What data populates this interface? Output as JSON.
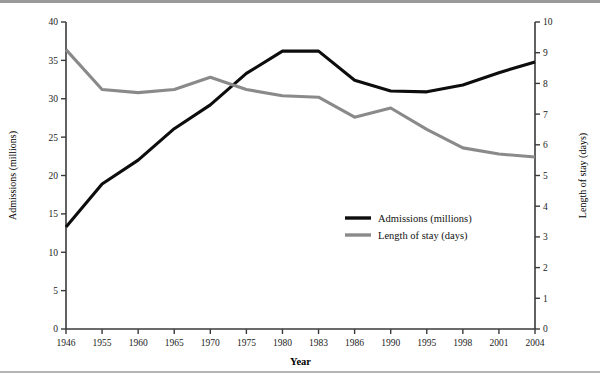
{
  "chart_data": {
    "type": "line",
    "title": "",
    "xlabel": "Year",
    "categories": [
      "1946",
      "1955",
      "1960",
      "1965",
      "1970",
      "1975",
      "1980",
      "1983",
      "1986",
      "1990",
      "1995",
      "1998",
      "2001",
      "2004"
    ],
    "grid": false,
    "legend_position": "center-right",
    "axes": {
      "left": {
        "label": "Admissions (millions)",
        "min": 0,
        "max": 40,
        "step": 5,
        "ticks": [
          "0",
          "5",
          "10",
          "15",
          "20",
          "25",
          "30",
          "35",
          "40"
        ]
      },
      "right": {
        "label": "Length of stay (days)",
        "min": 0,
        "max": 10,
        "step": 1,
        "ticks": [
          "0",
          "1",
          "2",
          "3",
          "4",
          "5",
          "6",
          "7",
          "8",
          "9",
          "10"
        ]
      }
    },
    "series": [
      {
        "name": "Admissions (millions)",
        "axis": "left",
        "color": "#0d0d0d",
        "values": [
          13.3,
          18.9,
          22.0,
          26.1,
          29.2,
          33.3,
          36.2,
          36.2,
          32.4,
          31.0,
          30.9,
          31.8,
          33.4,
          34.8
        ]
      },
      {
        "name": "Length of stay (days)",
        "axis": "right",
        "color": "#8a8a8a",
        "values": [
          9.1,
          7.8,
          7.7,
          7.8,
          8.2,
          7.8,
          7.6,
          7.55,
          6.9,
          7.2,
          6.5,
          5.9,
          5.7,
          5.6
        ]
      }
    ],
    "legend": [
      {
        "label": "Admissions (millions)",
        "color": "#0d0d0d"
      },
      {
        "label": "Length of stay (days)",
        "color": "#8a8a8a"
      }
    ]
  }
}
